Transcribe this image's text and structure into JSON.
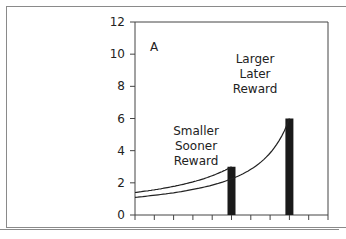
{
  "chart_data": {
    "type": "bar",
    "title": "",
    "panel_label": "A",
    "xlabel": "",
    "ylabel": "",
    "ylim": [
      0,
      12
    ],
    "yticks": [
      0,
      2,
      4,
      6,
      8,
      10,
      12
    ],
    "xlim": [
      0,
      10
    ],
    "x_tick_count": 11,
    "grid": false,
    "bars": [
      {
        "name": "Smaller Sooner Reward",
        "x": 5,
        "value": 3
      },
      {
        "name": "Larger Later Reward",
        "x": 8,
        "value": 6
      }
    ],
    "curves": [
      {
        "name": "Discount curve for smaller sooner reward",
        "type": "hyperbolic",
        "x_start": 0,
        "y_start": 1.4,
        "peak_x": 5,
        "peak_y": 3
      },
      {
        "name": "Discount curve for larger later reward",
        "type": "hyperbolic",
        "x_start": 0,
        "y_start": 1.1,
        "peak_x": 8,
        "peak_y": 6
      }
    ],
    "annotations": [
      {
        "text": "A",
        "x": 1.2,
        "y": 10
      },
      {
        "lines": [
          "Smaller",
          "Sooner",
          "Reward"
        ],
        "anchor_bar": 0
      },
      {
        "lines": [
          "Larger",
          "Later",
          "Reward"
        ],
        "anchor_bar": 1
      }
    ]
  },
  "labels": {
    "panel": "A",
    "sooner": [
      "Smaller",
      "Sooner",
      "Reward"
    ],
    "later": [
      "Larger",
      "Later",
      "Reward"
    ],
    "y": [
      "0",
      "2",
      "4",
      "6",
      "8",
      "10",
      "12"
    ]
  }
}
